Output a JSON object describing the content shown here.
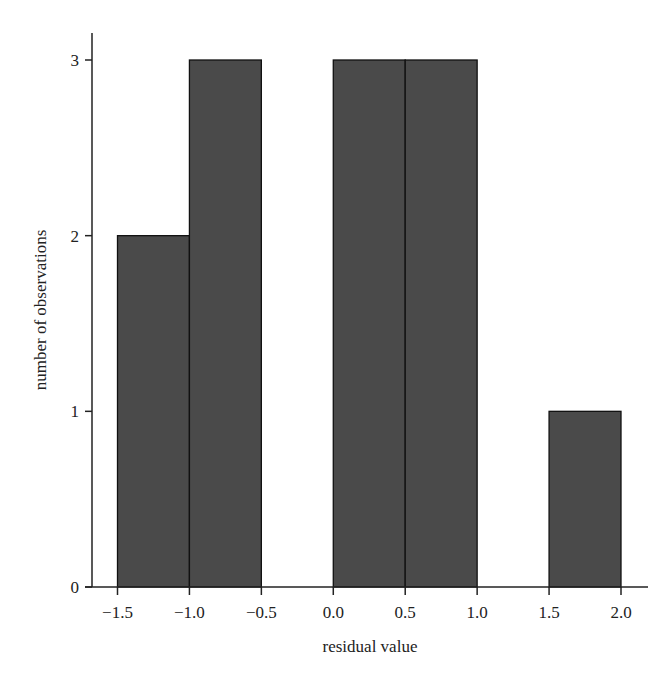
{
  "chart_data": {
    "type": "bar",
    "subtype": "histogram",
    "title": "",
    "xlabel": "residual value",
    "ylabel": "number of observations",
    "bins": [
      {
        "start": -1.5,
        "end": -1.0,
        "count": 2
      },
      {
        "start": -1.0,
        "end": -0.5,
        "count": 3
      },
      {
        "start": -0.5,
        "end": 0.0,
        "count": 0
      },
      {
        "start": 0.0,
        "end": 0.5,
        "count": 3
      },
      {
        "start": 0.5,
        "end": 1.0,
        "count": 3
      },
      {
        "start": 1.0,
        "end": 1.5,
        "count": 0
      },
      {
        "start": 1.5,
        "end": 2.0,
        "count": 1
      }
    ],
    "categories": [
      "-1.5 to -1.0",
      "-1.0 to -0.5",
      "-0.5 to 0.0",
      "0.0 to 0.5",
      "0.5 to 1.0",
      "1.0 to 1.5",
      "1.5 to 2.0"
    ],
    "values": [
      2,
      3,
      0,
      3,
      3,
      0,
      1
    ],
    "x_ticks": [
      "−1.5",
      "−1.0",
      "−0.5",
      "0.0",
      "0.5",
      "1.0",
      "1.5",
      "2.0"
    ],
    "x_tick_values": [
      -1.5,
      -1.0,
      -0.5,
      0.0,
      0.5,
      1.0,
      1.5,
      2.0
    ],
    "y_ticks": [
      "0",
      "1",
      "2",
      "3"
    ],
    "y_tick_values": [
      0,
      1,
      2,
      3
    ],
    "xlim": [
      -1.67,
      2.2
    ],
    "ylim": [
      0,
      3.15
    ],
    "grid": false,
    "legend": null,
    "bar_color": "#4a4a4a",
    "edge_color": "#111111"
  }
}
